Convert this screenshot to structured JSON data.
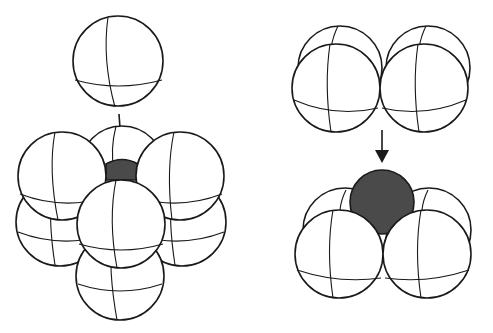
{
  "diagram": {
    "type": "sphere-packing-interstitial-sites",
    "panels": [
      {
        "id": "left",
        "description": "Octahedral interstitial site: a sphere approaches from above onto a square layer of four spheres stacked over a lower layer; the void (dark) is exposed at the center.",
        "falling_spheres": 1,
        "cluster_spheres": 8,
        "void_color": "#4a4a4a",
        "arrow": "down"
      },
      {
        "id": "right",
        "description": "Tetrahedral interstitial site: a pair of spheres approaches from above onto a pair of spheres; the void (dark sphere) sits between them.",
        "falling_spheres": 4,
        "cluster_spheres": 4,
        "void_color": "#4a4a4a",
        "arrow": "down"
      }
    ],
    "colors": {
      "sphere_fill": "#ffffff",
      "outline": "#1a1a1a",
      "void": "#4a4a4a",
      "background": "#ffffff"
    }
  }
}
